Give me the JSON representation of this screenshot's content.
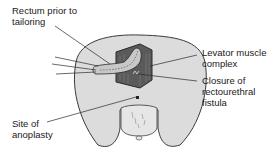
{
  "diagram": {
    "labels": {
      "rectum": "Rectum prior to\ntailoring",
      "levator": "Levator muscle\ncomplex",
      "closure": "Closure of\nrectourethral\nfistula",
      "anoplasty": "Site of\nanoplasty"
    },
    "colors": {
      "skin": "#dcdcdc",
      "outline": "#3a3a3a",
      "muscle": "#5a5a5a",
      "rectum": "#c8c8c8",
      "text": "#1a1a1a"
    }
  }
}
